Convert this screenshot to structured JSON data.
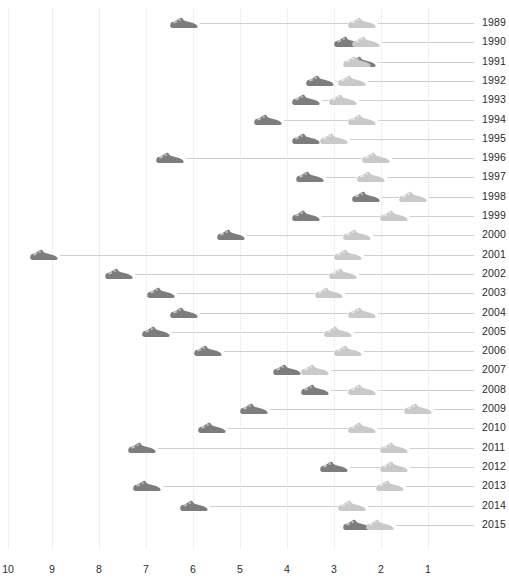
{
  "title": "",
  "axis": {
    "x_ticks": [
      "10",
      "9",
      "8",
      "7",
      "6",
      "5",
      "4",
      "3",
      "2",
      "1"
    ],
    "x_tick_positions": [
      8,
      52,
      99,
      146,
      193,
      240,
      287,
      334,
      381,
      428
    ],
    "x_min_value": 1,
    "x_max_value": 10,
    "reversed": true,
    "grid": "dotted-vertical",
    "row_line_color": "#cfcfcf",
    "dark_marker_color": "#7d7d7d",
    "light_marker_color": "#c9c9c9",
    "grid_color": "#e3e3e3",
    "text_color": "#2b2b2b"
  },
  "chart_data": {
    "type": "scatter",
    "title": "",
    "xlabel": "",
    "ylabel": "",
    "xlim": [
      10,
      1
    ],
    "grid": true,
    "legend": "none",
    "marker_icon": "sneaker-icon",
    "series": [
      {
        "name": "dark-shoe",
        "color": "#7d7d7d"
      },
      {
        "name": "light-shoe",
        "color": "#c9c9c9"
      }
    ],
    "categories": [
      "1989",
      "1990",
      "1991",
      "1992",
      "1993",
      "1994",
      "1995",
      "1996",
      "1997",
      "1998",
      "1999",
      "2000",
      "2001",
      "2002",
      "2003",
      "2004",
      "2005",
      "2006",
      "2007",
      "2008",
      "2009",
      "2010",
      "2011",
      "2012",
      "2013",
      "2014",
      "2015"
    ],
    "rows": [
      {
        "year": "1989",
        "dark": 6.2,
        "light": 2.4
      },
      {
        "year": "1990",
        "dark": 2.7,
        "light": 2.3
      },
      {
        "year": "1991",
        "dark": 2.4,
        "light": 2.5
      },
      {
        "year": "1992",
        "dark": 3.3,
        "light": 2.6
      },
      {
        "year": "1993",
        "dark": 3.6,
        "light": 2.8
      },
      {
        "year": "1994",
        "dark": 4.4,
        "light": 2.4
      },
      {
        "year": "1995",
        "dark": 3.6,
        "light": 3.0
      },
      {
        "year": "1996",
        "dark": 6.5,
        "light": 2.1
      },
      {
        "year": "1997",
        "dark": 3.5,
        "light": 2.2
      },
      {
        "year": "1998",
        "dark": 2.3,
        "light": 1.3
      },
      {
        "year": "1999",
        "dark": 3.6,
        "light": 1.7
      },
      {
        "year": "2000",
        "dark": 5.2,
        "light": 2.5
      },
      {
        "year": "2001",
        "dark": 9.2,
        "light": 2.7
      },
      {
        "year": "2002",
        "dark": 7.6,
        "light": 2.8
      },
      {
        "year": "2003",
        "dark": 6.7,
        "light": 3.1
      },
      {
        "year": "2004",
        "dark": 6.2,
        "light": 2.4
      },
      {
        "year": "2005",
        "dark": 6.8,
        "light": 2.9
      },
      {
        "year": "2006",
        "dark": 5.7,
        "light": 2.7
      },
      {
        "year": "2007",
        "dark": 4.0,
        "light": 3.4
      },
      {
        "year": "2008",
        "dark": 3.4,
        "light": 2.4
      },
      {
        "year": "2009",
        "dark": 4.7,
        "light": 1.2
      },
      {
        "year": "2010",
        "dark": 5.6,
        "light": 2.4
      },
      {
        "year": "2011",
        "dark": 7.1,
        "light": 1.7
      },
      {
        "year": "2012",
        "dark": 3.0,
        "light": 1.7
      },
      {
        "year": "2013",
        "dark": 7.0,
        "light": 1.8
      },
      {
        "year": "2014",
        "dark": 6.0,
        "light": 2.6
      },
      {
        "year": "2015",
        "dark": 2.5,
        "light": 2.0
      }
    ]
  },
  "layout": {
    "row_top": 23,
    "row_step": 19.3,
    "label_x": 482,
    "line_end_x": 474,
    "tick_y": 563,
    "shoe_half_width": 15
  }
}
